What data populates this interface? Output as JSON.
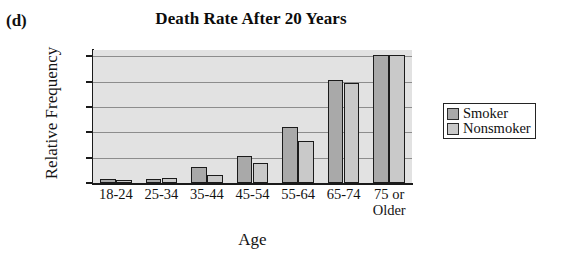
{
  "panel": {
    "letter": "(d)"
  },
  "chart_data": {
    "type": "bar",
    "title": "Death Rate After 20 Years",
    "xlabel": "Age",
    "ylabel": "Relative Frequency",
    "categories": [
      "18-24",
      "25-34",
      "35-44",
      "45-54",
      "55-64",
      "65-74",
      "75 or\nOlder"
    ],
    "series": [
      {
        "name": "Smoker",
        "values": [
          0.03,
          0.03,
          0.13,
          0.21,
          0.44,
          0.81,
          1.01
        ],
        "color": "#a9a9a9"
      },
      {
        "name": "Nonsmoker",
        "values": [
          0.02,
          0.04,
          0.06,
          0.16,
          0.33,
          0.79,
          1.01
        ],
        "color": "#c9c9c9"
      }
    ],
    "ylim": [
      0,
      1.05
    ],
    "yticks": [
      "0",
      "0.2",
      "0.4",
      "0.6",
      "0.8",
      "1"
    ],
    "ytick_values": [
      0,
      0.2,
      0.4,
      0.6,
      0.8,
      1
    ],
    "grid": true,
    "legend_position": "right",
    "plot_background": "#e2e2e2"
  }
}
